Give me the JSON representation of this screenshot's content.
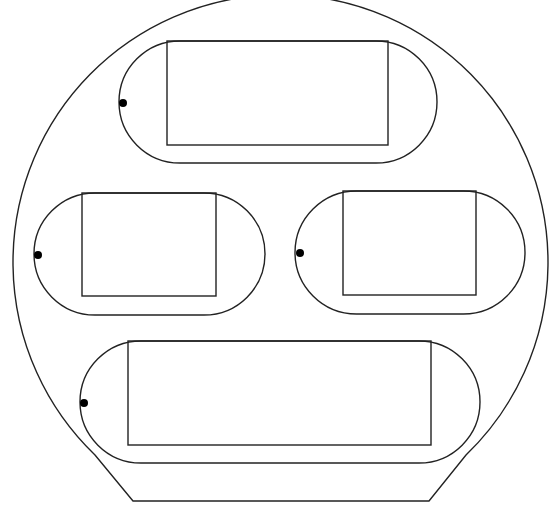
{
  "canvas": {
    "width": 556,
    "height": 523,
    "background": "#ffffff",
    "stroke_color": "#222222",
    "dot_color": "#000000"
  },
  "outline": {
    "shape": "truncated-circle",
    "center": [
      280.5,
      260.5
    ],
    "radius": 267.5,
    "arc_start": [
      95,
      455
    ],
    "arc_end": [
      466,
      455
    ],
    "bottom_left": [
      133,
      501
    ],
    "bottom_right": [
      429,
      501
    ]
  },
  "stadiums": [
    {
      "id": "top",
      "x": 119,
      "y": 41,
      "width": 318,
      "height": 122,
      "rect": {
        "x": 167,
        "y": 41,
        "width": 221,
        "height": 104
      },
      "dot": {
        "cx": 123,
        "cy": 103,
        "r": 4
      }
    },
    {
      "id": "middle-left",
      "x": 34,
      "y": 193,
      "width": 231,
      "height": 122,
      "rect": {
        "x": 82,
        "y": 193,
        "width": 134,
        "height": 103
      },
      "dot": {
        "cx": 38,
        "cy": 255,
        "r": 4
      }
    },
    {
      "id": "middle-right",
      "x": 295,
      "y": 191,
      "width": 230,
      "height": 123,
      "rect": {
        "x": 343,
        "y": 191,
        "width": 133,
        "height": 104
      },
      "dot": {
        "cx": 300,
        "cy": 253,
        "r": 4
      }
    },
    {
      "id": "bottom",
      "x": 80,
      "y": 341,
      "width": 400,
      "height": 122,
      "rect": {
        "x": 128,
        "y": 341,
        "width": 303,
        "height": 104
      },
      "dot": {
        "cx": 84,
        "cy": 403,
        "r": 4
      }
    }
  ]
}
